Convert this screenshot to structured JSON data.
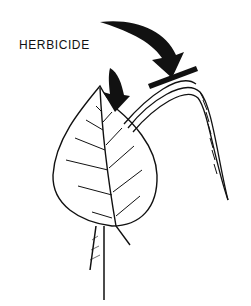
{
  "figure": {
    "label": "HERBICIDE",
    "elements": [
      "broadleaf-leaf",
      "grass-blade",
      "arrow-to-leaf",
      "arrow-to-grass-blade"
    ],
    "colors": {
      "ink": "#111111",
      "background": "#ffffff"
    }
  }
}
